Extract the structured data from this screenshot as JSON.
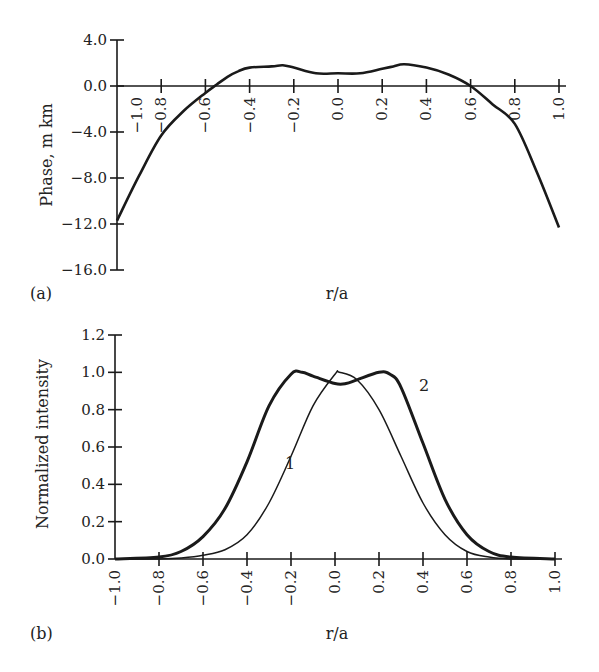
{
  "figure": {
    "panel_a_label": "(a)",
    "panel_b_label": "(b)"
  },
  "chart_data": [
    {
      "type": "line",
      "panel": "(a)",
      "title": "",
      "xlabel": "r/a",
      "ylabel": "Phase, m km",
      "xlim": [
        -1.0,
        1.0
      ],
      "ylim": [
        -16.0,
        4.0
      ],
      "x_ticks": [
        "-1.0",
        "-0.8",
        "-0.6",
        "-0.4",
        "-0.2",
        "0.0",
        "0.2",
        "0.4",
        "0.6",
        "0.8",
        "1.0"
      ],
      "y_ticks": [
        "4.0",
        "0.0",
        "-4.0",
        "-8.0",
        "-12.0",
        "-16.0"
      ],
      "grid": false,
      "series": [
        {
          "name": "phase",
          "x": [
            -1.0,
            -0.9,
            -0.8,
            -0.7,
            -0.6,
            -0.55,
            -0.5,
            -0.45,
            -0.4,
            -0.3,
            -0.25,
            -0.2,
            -0.1,
            0.0,
            0.1,
            0.2,
            0.25,
            0.3,
            0.4,
            0.5,
            0.6,
            0.7,
            0.8,
            0.9,
            1.0
          ],
          "y": [
            -11.7,
            -7.8,
            -4.3,
            -2.2,
            -0.6,
            0.1,
            0.8,
            1.3,
            1.6,
            1.7,
            1.8,
            1.6,
            1.1,
            1.1,
            1.1,
            1.5,
            1.7,
            1.9,
            1.6,
            1.0,
            0.0,
            -1.6,
            -3.3,
            -7.5,
            -12.3
          ]
        }
      ]
    },
    {
      "type": "line",
      "panel": "(b)",
      "title": "",
      "xlabel": "r/a",
      "ylabel": "Normalized intensity",
      "xlim": [
        -1.0,
        1.0
      ],
      "ylim": [
        0.0,
        1.2
      ],
      "x_ticks": [
        "-1.0",
        "-0.8",
        "-0.6",
        "-0.4",
        "-0.2",
        "0.0",
        "0.2",
        "0.4",
        "0.6",
        "0.8",
        "1.0"
      ],
      "y_ticks": [
        "1.2",
        "1.0",
        "0.8",
        "0.6",
        "0.4",
        "0.2",
        "0.0"
      ],
      "grid": false,
      "annotations": [
        "1",
        "2"
      ],
      "series": [
        {
          "name": "1",
          "style": "thin",
          "x": [
            -1.0,
            -0.8,
            -0.7,
            -0.6,
            -0.5,
            -0.4,
            -0.3,
            -0.2,
            -0.1,
            0.0,
            0.02,
            0.1,
            0.2,
            0.3,
            0.4,
            0.5,
            0.6,
            0.7,
            0.8,
            1.0
          ],
          "y": [
            0.0,
            0.0,
            0.005,
            0.02,
            0.05,
            0.13,
            0.3,
            0.55,
            0.82,
            0.99,
            1.0,
            0.96,
            0.8,
            0.55,
            0.3,
            0.13,
            0.04,
            0.01,
            0.0,
            0.0
          ]
        },
        {
          "name": "2",
          "style": "thick",
          "x": [
            -1.0,
            -0.8,
            -0.7,
            -0.6,
            -0.5,
            -0.4,
            -0.3,
            -0.2,
            -0.15,
            -0.1,
            0.0,
            0.05,
            0.1,
            0.2,
            0.25,
            0.3,
            0.4,
            0.5,
            0.6,
            0.7,
            0.8,
            1.0
          ],
          "y": [
            0.0,
            0.01,
            0.04,
            0.12,
            0.27,
            0.52,
            0.82,
            0.99,
            1.0,
            0.98,
            0.94,
            0.94,
            0.96,
            1.0,
            0.99,
            0.92,
            0.62,
            0.32,
            0.13,
            0.04,
            0.01,
            0.0
          ]
        }
      ]
    }
  ]
}
